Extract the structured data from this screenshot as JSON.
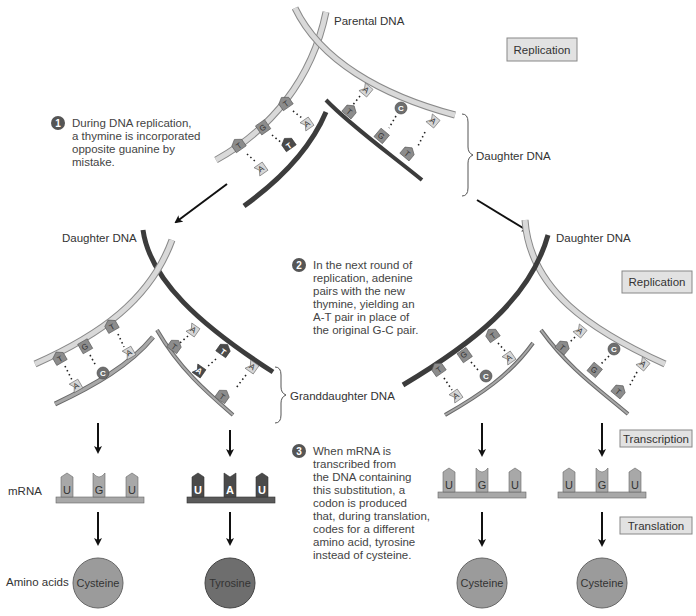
{
  "labels": {
    "parental_dna": "Parental DNA",
    "daughter_dna_top": "Daughter DNA",
    "daughter_dna_left": "Daughter DNA",
    "daughter_dna_right": "Daughter DNA",
    "granddaughter_dna": "Granddaughter DNA",
    "mrna": "mRNA",
    "amino_acids": "Amino acids"
  },
  "process_boxes": {
    "replication_top": "Replication",
    "replication_mid": "Replication",
    "transcription": "Transcription",
    "translation": "Translation"
  },
  "steps": [
    {
      "number": "1",
      "lines": [
        "During DNA replication,",
        "a thymine is incorporated",
        "opposite guanine by",
        "mistake."
      ]
    },
    {
      "number": "2",
      "lines": [
        "In the next round of",
        "replication, adenine",
        "pairs with the new",
        "thymine, yielding an",
        "A-T pair in place of",
        "the original G-C pair."
      ]
    },
    {
      "number": "3",
      "lines": [
        "When mRNA is",
        "transcribed from",
        "the DNA containing",
        "this substitution, a",
        "codon is produced",
        "that, during translation,",
        "codes for a different",
        "amino acid, tyrosine",
        "instead of cysteine."
      ]
    }
  ],
  "bases": {
    "T": "T",
    "A": "A",
    "G": "G",
    "C": "C",
    "U": "U"
  },
  "codons": [
    {
      "bases": [
        "U",
        "G",
        "U"
      ],
      "mutant": false
    },
    {
      "bases": [
        "U",
        "A",
        "U"
      ],
      "mutant": true
    },
    {
      "bases": [
        "U",
        "G",
        "U"
      ],
      "mutant": false
    },
    {
      "bases": [
        "U",
        "G",
        "U"
      ],
      "mutant": false
    }
  ],
  "amino_acids": [
    "Cysteine",
    "Tyrosine",
    "Cysteine",
    "Cysteine"
  ],
  "colors": {
    "light_strand": "#d6d6d6",
    "light_strand_edge": "#8a8a8a",
    "dark_strand": "#3c3c3c",
    "medium_strand": "#9a9a9a",
    "base_mid": "#8c8c8c",
    "base_light": "#d4d4d4",
    "base_dark": "#4a4a4a",
    "circle_fill": "#9b9b9b",
    "circle_dark": "#6e6e6e",
    "box_fill": "#e2e2e2"
  }
}
